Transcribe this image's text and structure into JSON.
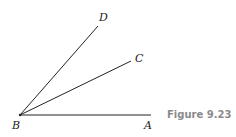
{
  "figure": {
    "caption": "Figure 9.23",
    "points": {
      "A": "A",
      "B": "B",
      "C": "C",
      "D": "D"
    },
    "rays": [
      {
        "from": "B",
        "to": "A"
      },
      {
        "from": "B",
        "to": "C"
      },
      {
        "from": "B",
        "to": "D"
      }
    ],
    "colors": {
      "line": "#222222",
      "caption": "#8a8a8a"
    }
  }
}
